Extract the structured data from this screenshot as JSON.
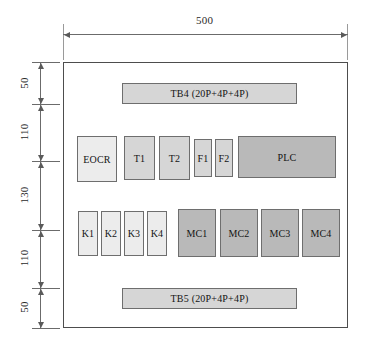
{
  "drawing": {
    "title": "Control panel internal component layout",
    "overall_width_label": "500",
    "vertical_dimensions": [
      "50",
      "110",
      "130",
      "110",
      "50"
    ],
    "colors": {
      "outline": "#4d4d4d",
      "component_border": "#6e6e6e",
      "fill_light": "#ececec",
      "fill_mid": "#d6d6d6",
      "fill_dark": "#b9b9b9",
      "dimension_line": "#6b6b6b"
    }
  },
  "components": {
    "terminal_block_top": {
      "label": "TB4 (20P+4P+4P)"
    },
    "terminal_block_bottom": {
      "label": "TB5 (20P+4P+4P)"
    },
    "row_middle": [
      {
        "label": "EOCR"
      },
      {
        "label": "T1"
      },
      {
        "label": "T2"
      },
      {
        "label": "F1"
      },
      {
        "label": "F2"
      },
      {
        "label": "PLC"
      }
    ],
    "row_lower_relays": [
      {
        "label": "K1"
      },
      {
        "label": "K2"
      },
      {
        "label": "K3"
      },
      {
        "label": "K4"
      }
    ],
    "row_lower_contactors": [
      {
        "label": "MC1"
      },
      {
        "label": "MC2"
      },
      {
        "label": "MC3"
      },
      {
        "label": "MC4"
      }
    ]
  }
}
